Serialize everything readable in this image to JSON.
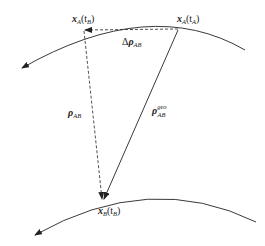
{
  "diagram": {
    "colors": {
      "line": "#222222",
      "background": "#ffffff"
    },
    "labels": {
      "xB_top": {
        "main": "x",
        "sub": "A",
        "arg": "(t",
        "argsub": "B",
        "close": ")"
      },
      "xA_top": {
        "main": "x",
        "sub": "A",
        "arg": "(t",
        "argsub": "A",
        "close": ")"
      },
      "delta_rho": {
        "prefix": "Δ",
        "main": "ρ",
        "sub": "AB"
      },
      "rho_AB": {
        "main": "ρ",
        "sub": "AB"
      },
      "rho_geo": {
        "main": "ρ",
        "sup": "geo",
        "sub": "AB"
      },
      "xB_bottom": {
        "main": "x",
        "sub": "B",
        "arg": "(t",
        "argsub": "B",
        "close": ")"
      }
    },
    "elements": [
      "orbit-A-curve (top, arrow pointing left)",
      "orbit-B-curve (bottom, arrow pointing left)",
      "dashed arrow from xA(tA) to xA(tB)",
      "dashed arrow from xA(tB) to xB(tB)",
      "solid arrow from xA(tA) to xB(tB)"
    ]
  }
}
